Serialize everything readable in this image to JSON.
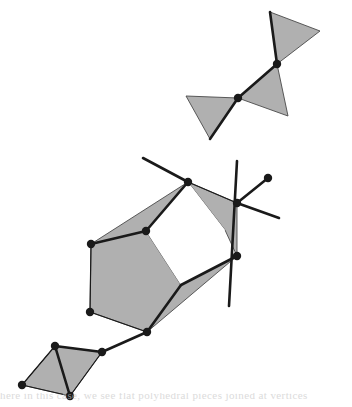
{
  "figure": {
    "caption_fragment": "here in this case, we see flat polyhedral pieces joined at vertices",
    "background_color": "#ffffff",
    "face_fill_color": "#b0b0b0",
    "face_stroke_color": "#4a4a4a",
    "edge_color": "#1a1a1a",
    "node_color": "#1a1a1a",
    "hole_fill_color": "#ffffff",
    "node_radius": 4.2,
    "edge_width": 2.6,
    "thin_edge_width": 1.2
  },
  "chart_data": {
    "type": "diagram",
    "xlabel": "",
    "ylabel": "",
    "xlim": [
      0,
      352
    ],
    "ylim": [
      0,
      407
    ],
    "grid": false,
    "legend": "none",
    "groups": [
      {
        "name": "upper-triangle-pair",
        "faces": [
          {
            "name": "upper-right-triangle",
            "points": [
              [
                270,
                12
              ],
              [
                320,
                31
              ],
              [
                277,
                64
              ]
            ],
            "filled": true
          },
          {
            "name": "upper-middle-triangle",
            "points": [
              [
                277,
                64
              ],
              [
                288,
                116
              ],
              [
                238,
                98
              ]
            ],
            "filled": true
          },
          {
            "name": "upper-left-triangle",
            "points": [
              [
                238,
                98
              ],
              [
                186,
                96
              ],
              [
                210,
                139
              ]
            ],
            "filled": true
          }
        ],
        "edges": [
          {
            "name": "edge-upper-right-spine",
            "from": [
              270,
              12
            ],
            "to": [
              277,
              64
            ],
            "weight": "thick"
          },
          {
            "name": "edge-upper-middle-spine",
            "from": [
              277,
              64
            ],
            "to": [
              238,
              98
            ],
            "weight": "thick"
          },
          {
            "name": "edge-upper-left-spine",
            "from": [
              238,
              98
            ],
            "to": [
              210,
              139
            ],
            "weight": "thick"
          }
        ],
        "nodes": [
          {
            "name": "node-upper-junction-a",
            "x": 277,
            "y": 64
          },
          {
            "name": "node-upper-junction-b",
            "x": 238,
            "y": 98
          }
        ]
      },
      {
        "name": "main-polygon-assembly",
        "faces": [
          {
            "name": "face-upper-left-wing",
            "points": [
              [
                188,
                182
              ],
              [
                146,
                231
              ],
              [
                91,
                244
              ]
            ],
            "filled": true
          },
          {
            "name": "face-upper-right-wing",
            "points": [
              [
                188,
                182
              ],
              [
                225,
                230
              ],
              [
                237,
                256
              ],
              [
                237,
                203
              ]
            ],
            "filled": true
          },
          {
            "name": "face-left-body",
            "points": [
              [
                91,
                244
              ],
              [
                146,
                231
              ],
              [
                181,
                285
              ],
              [
                147,
                332
              ],
              [
                90,
                312
              ]
            ],
            "filled": true
          },
          {
            "name": "face-lower-right-wing",
            "points": [
              [
                181,
                285
              ],
              [
                237,
                256
              ],
              [
                147,
                332
              ]
            ],
            "filled": true
          },
          {
            "name": "hole-center-quad",
            "points": [
              [
                188,
                182
              ],
              [
                146,
                231
              ],
              [
                181,
                285
              ],
              [
                225,
                230
              ]
            ],
            "filled": false
          }
        ],
        "edges": [
          {
            "name": "edge-top-node-to-upper-left",
            "from": [
              188,
              182
            ],
            "to": [
              146,
              231
            ],
            "weight": "thick"
          },
          {
            "name": "edge-upper-left-to-left-corner",
            "from": [
              146,
              231
            ],
            "to": [
              91,
              244
            ],
            "weight": "thick"
          },
          {
            "name": "edge-left-corner-to-bottom-left",
            "from": [
              91,
              244
            ],
            "to": [
              90,
              312
            ],
            "weight": "thin"
          },
          {
            "name": "edge-bottom-left-to-bottom-node",
            "from": [
              90,
              312
            ],
            "to": [
              147,
              332
            ],
            "weight": "thin"
          },
          {
            "name": "edge-bottom-node-to-hole-bottom",
            "from": [
              147,
              332
            ],
            "to": [
              181,
              285
            ],
            "weight": "thick"
          },
          {
            "name": "edge-hole-bottom-to-right-node",
            "from": [
              181,
              285
            ],
            "to": [
              237,
              256
            ],
            "weight": "thick"
          },
          {
            "name": "edge-ray-upper-left",
            "from": [
              188,
              182
            ],
            "to": [
              143,
              158
            ],
            "weight": "thick"
          },
          {
            "name": "edge-ray-upper-right",
            "from": [
              188,
              182
            ],
            "to": [
              237,
              203
            ],
            "weight": "thin"
          },
          {
            "name": "edge-radial-vertical",
            "from": [
              237,
              161
            ],
            "to": [
              229,
              306
            ],
            "weight": "thick"
          },
          {
            "name": "edge-radial-to-endpoint",
            "from": [
              237,
              203
            ],
            "to": [
              268,
              178
            ],
            "weight": "thick"
          },
          {
            "name": "edge-radial-lower-right",
            "from": [
              237,
              203
            ],
            "to": [
              279,
              218
            ],
            "weight": "thick"
          },
          {
            "name": "edge-bottom-node-to-chain",
            "from": [
              147,
              332
            ],
            "to": [
              102,
              352
            ],
            "weight": "thick"
          }
        ],
        "nodes": [
          {
            "name": "node-main-top",
            "x": 188,
            "y": 182
          },
          {
            "name": "node-main-upper-left",
            "x": 146,
            "y": 231
          },
          {
            "name": "node-main-left-corner",
            "x": 91,
            "y": 244
          },
          {
            "name": "node-main-bottom-left",
            "x": 90,
            "y": 312
          },
          {
            "name": "node-main-bottom",
            "x": 147,
            "y": 332
          },
          {
            "name": "node-main-right-upper",
            "x": 237,
            "y": 203
          },
          {
            "name": "node-main-right-lower",
            "x": 237,
            "y": 256
          },
          {
            "name": "node-radial-endpoint",
            "x": 268,
            "y": 178
          }
        ]
      },
      {
        "name": "lower-left-rhombus",
        "faces": [
          {
            "name": "face-rhombus-left",
            "points": [
              [
                55,
                346
              ],
              [
                22,
                385
              ],
              [
                70,
                396
              ]
            ],
            "filled": true
          },
          {
            "name": "face-rhombus-right",
            "points": [
              [
                55,
                346
              ],
              [
                70,
                396
              ],
              [
                102,
                352
              ]
            ],
            "filled": true
          }
        ],
        "edges": [
          {
            "name": "edge-rhombus-diagonal",
            "from": [
              55,
              346
            ],
            "to": [
              70,
              396
            ],
            "weight": "thick"
          },
          {
            "name": "edge-rhombus-top-right",
            "from": [
              55,
              346
            ],
            "to": [
              102,
              352
            ],
            "weight": "thick"
          },
          {
            "name": "edge-rhombus-bottom-right",
            "from": [
              70,
              396
            ],
            "to": [
              102,
              352
            ],
            "weight": "thin"
          },
          {
            "name": "edge-rhombus-top-left",
            "from": [
              55,
              346
            ],
            "to": [
              22,
              385
            ],
            "weight": "thin"
          },
          {
            "name": "edge-rhombus-bottom-left",
            "from": [
              22,
              385
            ],
            "to": [
              70,
              396
            ],
            "weight": "thin"
          }
        ],
        "nodes": [
          {
            "name": "node-rhombus-top",
            "x": 55,
            "y": 346
          },
          {
            "name": "node-rhombus-left",
            "x": 22,
            "y": 385
          },
          {
            "name": "node-rhombus-bottom",
            "x": 70,
            "y": 396
          },
          {
            "name": "node-rhombus-right",
            "x": 102,
            "y": 352
          }
        ]
      }
    ]
  }
}
